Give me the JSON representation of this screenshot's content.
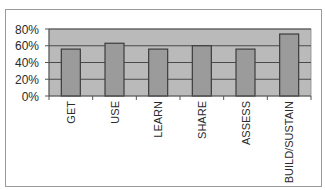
{
  "chart_data": {
    "type": "bar",
    "title": "",
    "xlabel": "",
    "ylabel": "",
    "categories": [
      "GET",
      "USE",
      "LEARN",
      "SHARE",
      "ASSESS",
      "BUILD/SUSTAIN"
    ],
    "values": [
      0.56,
      0.63,
      0.56,
      0.6,
      0.56,
      0.74
    ],
    "ylim": [
      0,
      0.8
    ],
    "yticks": [
      0,
      0.2,
      0.4,
      0.6,
      0.8
    ],
    "ytick_labels": [
      "0%",
      "20%",
      "40%",
      "60%",
      "80%"
    ],
    "grid": true,
    "legend": "none",
    "colors": {
      "plot_background": "#bababa",
      "bar_fill": "#9b9b9b",
      "bar_outline": "#3c3c3c",
      "gridline": "#4a4a4a",
      "axis": "#555555"
    }
  }
}
